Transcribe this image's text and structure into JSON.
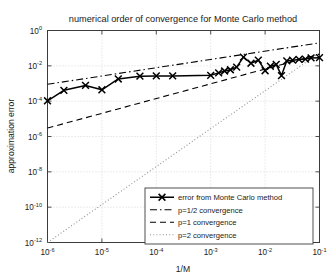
{
  "figure": {
    "title": "numerical order of convergence for Monte Carlo method",
    "background_color": "#ffffff"
  },
  "axes": {
    "xlabel": "1/M",
    "ylabel": "approximation error",
    "x_ticks": [
      {
        "mantissa": "10",
        "exponent": "-6",
        "value": 1e-06
      },
      {
        "mantissa": "10",
        "exponent": "-5",
        "value": 1e-05
      },
      {
        "mantissa": "10",
        "exponent": "-4",
        "value": 0.0001
      },
      {
        "mantissa": "10",
        "exponent": "-3",
        "value": 0.001
      },
      {
        "mantissa": "10",
        "exponent": "-2",
        "value": 0.01
      },
      {
        "mantissa": "10",
        "exponent": "-1",
        "value": 0.1
      }
    ],
    "y_ticks": [
      {
        "mantissa": "10",
        "exponent": "0",
        "value": 1
      },
      {
        "mantissa": "10",
        "exponent": "-2",
        "value": 0.01
      },
      {
        "mantissa": "10",
        "exponent": "-4",
        "value": 0.0001
      },
      {
        "mantissa": "10",
        "exponent": "-6",
        "value": 1e-06
      },
      {
        "mantissa": "10",
        "exponent": "-8",
        "value": 1e-08
      },
      {
        "mantissa": "10",
        "exponent": "-10",
        "value": 1e-10
      },
      {
        "mantissa": "10",
        "exponent": "-12",
        "value": 1e-12
      }
    ],
    "frame_color": "#3c3c3c",
    "grid_color": "#c8c8c8"
  },
  "legend": {
    "items": [
      {
        "label": "error from Monte Carlo method",
        "style": "solid-marker"
      },
      {
        "label": "p=1/2 convergence",
        "style": "dashdot"
      },
      {
        "label": "p=1 convergence",
        "style": "dashed"
      },
      {
        "label": "p=2 convergence",
        "style": "dotted"
      }
    ],
    "border_color": "#3c3c3c",
    "background_color": "#ffffff"
  },
  "chart_data": {
    "type": "line",
    "title": "numerical order of convergence for Monte Carlo method",
    "xlabel": "1/M",
    "ylabel": "approximation error",
    "xscale": "log",
    "yscale": "log",
    "xlim": [
      1e-06,
      0.1
    ],
    "ylim": [
      1e-12,
      1.0
    ],
    "grid": true,
    "legend_position": "lower right",
    "series": [
      {
        "name": "error from Monte Carlo method",
        "style": "solid",
        "marker": "x",
        "color": "#000000",
        "x": [
          1e-06,
          2e-06,
          5e-06,
          1e-05,
          2e-05,
          5e-05,
          0.0001,
          0.0002,
          0.001,
          0.0014,
          0.0018,
          0.0023,
          0.003,
          0.004,
          0.0055,
          0.0075,
          0.01,
          0.0125,
          0.016,
          0.02,
          0.025,
          0.032,
          0.042,
          0.055,
          0.07,
          0.1
        ],
        "y": [
          0.000105,
          0.00041,
          0.00078,
          0.00044,
          0.0018,
          0.0026,
          0.0027,
          0.0027,
          0.0029,
          0.004,
          0.0051,
          0.006,
          0.0085,
          0.031,
          0.014,
          0.021,
          0.0053,
          0.0095,
          0.012,
          0.0028,
          0.019,
          0.021,
          0.023,
          0.024,
          0.028,
          0.029
        ]
      },
      {
        "name": "p=1/2 convergence",
        "style": "dashdot",
        "color": "#000000",
        "x": [
          1e-06,
          0.1
        ],
        "y": [
          0.0009,
          0.2
        ]
      },
      {
        "name": "p=1 convergence",
        "style": "dashed",
        "color": "#000000",
        "x": [
          1e-06,
          0.1
        ],
        "y": [
          3e-06,
          0.045
        ]
      },
      {
        "name": "p=2 convergence",
        "style": "dotted",
        "color": "#909090",
        "x": [
          1e-06,
          0.1
        ],
        "y": [
          1e-12,
          0.055
        ]
      }
    ]
  }
}
